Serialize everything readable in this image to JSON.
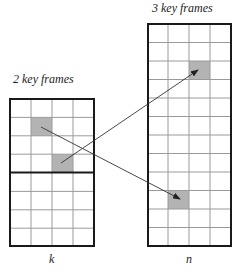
{
  "labels": {
    "left_title": "2 key frames",
    "right_title": "3 key frames",
    "left_axis": "k",
    "right_axis": "n"
  },
  "left_block": {
    "columns": 4,
    "rows": 8,
    "divider_after_row": 4,
    "highlighted_cells": [
      {
        "row": 1,
        "col": 1
      },
      {
        "row": 3,
        "col": 2
      }
    ]
  },
  "right_block": {
    "columns": 4,
    "rows": 12,
    "highlighted_cells": [
      {
        "row": 2,
        "col": 2
      },
      {
        "row": 9,
        "col": 1
      }
    ]
  },
  "arrows": [
    {
      "from": "left row1 col1",
      "to": "right row9 col1"
    },
    {
      "from": "left row3 col2",
      "to": "right row2 col2"
    }
  ],
  "colors": {
    "grid_line": "#9a9a9a",
    "border": "#1a1a1a",
    "highlight": "#b3b3b3",
    "arrow": "#333333"
  }
}
